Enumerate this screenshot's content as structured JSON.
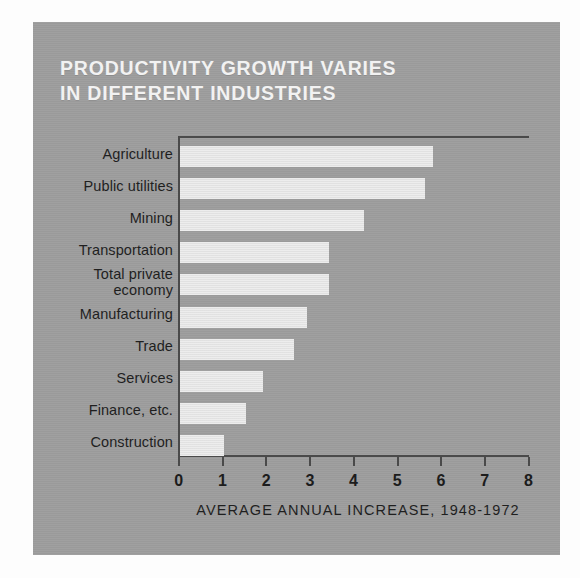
{
  "title": {
    "line1": "PRODUCTIVITY GROWTH VARIES",
    "line2": "IN DIFFERENT INDUSTRIES"
  },
  "caption": "AVERAGE ANNUAL INCREASE, 1948-1972",
  "colors": {
    "card_background": "#9d9d9d",
    "bar_fill": "#e4e4e4",
    "axis_line": "#4a4a4a",
    "title_text": "#f2f2f2",
    "label_text": "#1f1f1f",
    "page_background": "#fdfdfd"
  },
  "chart_data": {
    "type": "bar",
    "orientation": "horizontal",
    "title": "PRODUCTIVITY GROWTH VARIES IN DIFFERENT INDUSTRIES",
    "subtitle": "AVERAGE ANNUAL INCREASE, 1948-1972",
    "xlabel": "",
    "ylabel": "",
    "xlim": [
      0,
      8
    ],
    "xticks": [
      0,
      1,
      2,
      3,
      4,
      5,
      6,
      7,
      8
    ],
    "xtick_labels": [
      "0",
      "1",
      "2",
      "3",
      "4",
      "5",
      "6",
      "7",
      "8"
    ],
    "grid": false,
    "legend": false,
    "categories": [
      "Agriculture",
      "Public utilities",
      "Mining",
      "Transportation",
      "Total private\neconomy",
      "Manufacturing",
      "Trade",
      "Services",
      "Finance, etc.",
      "Construction"
    ],
    "values": [
      5.8,
      5.6,
      4.2,
      3.4,
      3.4,
      2.9,
      2.6,
      1.9,
      1.5,
      1.0
    ]
  }
}
